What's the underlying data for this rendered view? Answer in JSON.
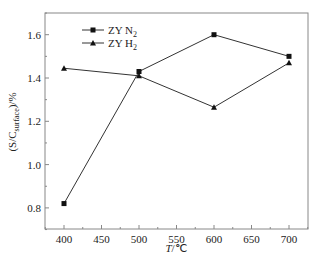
{
  "chart_data": {
    "type": "line",
    "title": "",
    "xlabel": "T/℃",
    "ylabel": "(S/C_surface)/%",
    "x": [
      400,
      500,
      600,
      700
    ],
    "series": [
      {
        "name": "ZY N2",
        "marker": "square",
        "values": [
          0.82,
          1.43,
          1.6,
          1.5
        ]
      },
      {
        "name": "ZY H2",
        "marker": "triangle",
        "values": [
          1.445,
          1.41,
          1.265,
          1.47
        ]
      }
    ],
    "xlim": [
      375,
      725
    ],
    "ylim": [
      0.7,
      1.7
    ],
    "xticks": [
      400,
      450,
      500,
      550,
      600,
      650,
      700
    ],
    "yticks": [
      0.8,
      1.0,
      1.2,
      1.4,
      1.6
    ],
    "grid": false,
    "legend_position": "upper left"
  },
  "axes": {
    "xtick_labels": [
      "400",
      "450",
      "500",
      "550",
      "600",
      "650",
      "700"
    ],
    "ytick_labels": [
      "0.8",
      "1.0",
      "1.2",
      "1.4",
      "1.6"
    ],
    "xlabel_italic": "T",
    "xlabel_unit": "/℃",
    "ylabel_main": "(S/C",
    "ylabel_sub": "surface",
    "ylabel_tail": ")/%"
  },
  "legend": {
    "items": [
      {
        "label_main": "ZY N",
        "label_sub": "2"
      },
      {
        "label_main": "ZY H",
        "label_sub": "2"
      }
    ]
  }
}
